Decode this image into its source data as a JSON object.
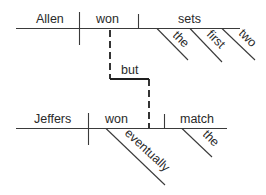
{
  "diagram": {
    "type": "sentence-diagram",
    "clause1": {
      "subject": "Allen",
      "verb": "won",
      "object": "sets",
      "object_modifiers": [
        "the",
        "first",
        "two"
      ]
    },
    "conjunction": "but",
    "clause2": {
      "subject": "Jeffers",
      "verb": "won",
      "verb_modifiers": [
        "eventually"
      ],
      "object": "match",
      "object_modifiers": [
        "the"
      ]
    }
  }
}
